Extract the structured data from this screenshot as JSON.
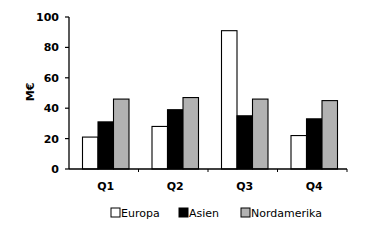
{
  "chart_data": {
    "type": "bar",
    "title": "",
    "xlabel": "",
    "ylabel": "M€",
    "ylim": [
      0,
      100
    ],
    "yticks": [
      0,
      20,
      40,
      60,
      80,
      100
    ],
    "grid": false,
    "legend_position": "bottom",
    "categories": [
      "Q1",
      "Q2",
      "Q3",
      "Q4"
    ],
    "series": [
      {
        "name": "Europa",
        "color": "#ffffff",
        "values": [
          21,
          28,
          91,
          22
        ]
      },
      {
        "name": "Asien",
        "color": "#000000",
        "values": [
          31,
          39,
          35,
          33
        ]
      },
      {
        "name": "Nordamerika",
        "color": "#b2b2b2",
        "values": [
          46,
          47,
          46,
          45
        ]
      }
    ]
  }
}
